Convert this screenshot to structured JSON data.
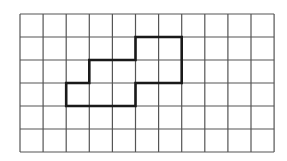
{
  "diagram": {
    "type": "grid-shape",
    "grid": {
      "columns": 11,
      "rows": 6,
      "origin_px": [
        20,
        14
      ],
      "cell_width_px": 23.1,
      "cell_height_px": 23,
      "line_color": "#555555",
      "line_width": 1.2
    },
    "shape": {
      "description": "Closed rectilinear polygon drawn with bold outline on the grid",
      "vertices_grid": [
        [
          5,
          1
        ],
        [
          7,
          1
        ],
        [
          7,
          3
        ],
        [
          5,
          3
        ],
        [
          5,
          4
        ],
        [
          2,
          4
        ],
        [
          2,
          3
        ],
        [
          3,
          3
        ],
        [
          3,
          2
        ],
        [
          5,
          2
        ]
      ],
      "stroke_color": "#1a1a1a",
      "stroke_width": 2.6,
      "cells_covered": 8
    },
    "background": "#ffffff"
  }
}
